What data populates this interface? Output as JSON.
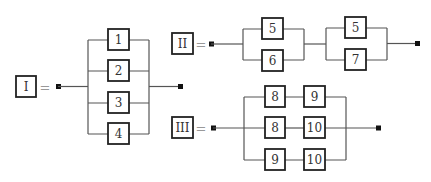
{
  "diagrams": {
    "I": {
      "label": "I",
      "equals": "=",
      "type": "parallel",
      "components": [
        "1",
        "2",
        "3",
        "4"
      ]
    },
    "II": {
      "label": "II",
      "equals": "=",
      "type": "series-of-parallel",
      "groups": [
        {
          "components": [
            "5",
            "6"
          ]
        },
        {
          "components": [
            "5",
            "7"
          ]
        }
      ]
    },
    "III": {
      "label": "III",
      "equals": "=",
      "type": "parallel-of-series",
      "rows": [
        {
          "components": [
            "8",
            "9"
          ]
        },
        {
          "components": [
            "8",
            "10"
          ]
        },
        {
          "components": [
            "9",
            "10"
          ]
        }
      ]
    }
  }
}
